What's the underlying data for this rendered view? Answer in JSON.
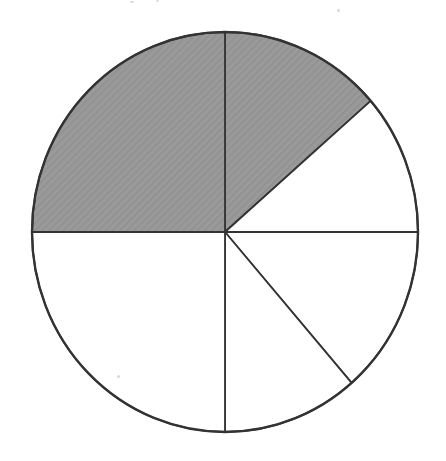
{
  "chart_data": {
    "type": "pie",
    "title": "",
    "angle_convention": "degrees clockwise from 12 o'clock",
    "sectors": [
      {
        "label": "top-right-eighth",
        "start_angle": 0,
        "end_angle": 49,
        "fraction": "1/8",
        "shaded": true
      },
      {
        "label": "right-upper-eighth",
        "start_angle": 49,
        "end_angle": 90,
        "fraction": "1/8",
        "shaded": false
      },
      {
        "label": "right-lower-eighth",
        "start_angle": 90,
        "end_angle": 139,
        "fraction": "1/8",
        "shaded": false
      },
      {
        "label": "bottom-right-eighth",
        "start_angle": 139,
        "end_angle": 180,
        "fraction": "1/8",
        "shaded": false
      },
      {
        "label": "bottom-left-quarter",
        "start_angle": 180,
        "end_angle": 270,
        "fraction": "1/4",
        "shaded": false
      },
      {
        "label": "top-left-quarter",
        "start_angle": 270,
        "end_angle": 360,
        "fraction": "1/4",
        "shaded": true
      }
    ],
    "shaded_fraction": "3/8",
    "legend_shown": false,
    "grid_shown": false,
    "colors": {
      "shaded": "#979797",
      "unshaded": "#ffffff",
      "outline": "#333333",
      "background": "#ffffff"
    }
  }
}
